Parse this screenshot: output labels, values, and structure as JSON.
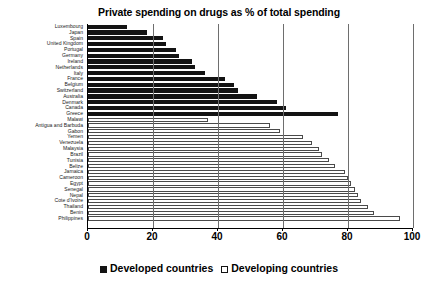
{
  "chart_data": {
    "type": "bar",
    "orientation": "horizontal",
    "title": "Private spending on drugs as % of total spending",
    "xlabel": "",
    "ylabel": "",
    "xlim": [
      0,
      100
    ],
    "xticks": [
      0,
      20,
      40,
      60,
      80,
      100
    ],
    "grid": true,
    "legend_position": "bottom",
    "legend": [
      {
        "label": "Developed countries",
        "marker": "filled-square",
        "color": "#131313"
      },
      {
        "label": "Developing countries",
        "marker": "open-square",
        "color": "#ffffff"
      }
    ],
    "categories": [
      "Luxembourg",
      "Japan",
      "Spain",
      "United  Kingdom",
      "Portugal",
      "Germany",
      "Ireland",
      "Netherlands",
      "Italy",
      "France",
      "Belgium",
      "Switzerland",
      "Australia",
      "Denmark",
      "Canada",
      "Greece",
      "Malawi",
      "Antigua and Barbuda",
      "Gabon",
      "Yemen",
      "Venezuela",
      "Malaysia",
      "Brazil",
      "Tunisia",
      "Belize",
      "Jamaica",
      "Cameroon",
      "Egypt",
      "Senegal",
      "Nepal",
      "Cote d'Ivoire",
      "Thailand",
      "Benin",
      "Philippines"
    ],
    "values": [
      12,
      18,
      23,
      24,
      27,
      28,
      32,
      33,
      36,
      42,
      45,
      46,
      52,
      58,
      61,
      77,
      37,
      56,
      59,
      66,
      69,
      71,
      72,
      74,
      76,
      79,
      80,
      81,
      82,
      83,
      84,
      86,
      88,
      96
    ],
    "groups": [
      "Developed countries",
      "Developed countries",
      "Developed countries",
      "Developed countries",
      "Developed countries",
      "Developed countries",
      "Developed countries",
      "Developed countries",
      "Developed countries",
      "Developed countries",
      "Developed countries",
      "Developed countries",
      "Developed countries",
      "Developed countries",
      "Developed countries",
      "Developed countries",
      "Developing countries",
      "Developing countries",
      "Developing countries",
      "Developing countries",
      "Developing countries",
      "Developing countries",
      "Developing countries",
      "Developing countries",
      "Developing countries",
      "Developing countries",
      "Developing countries",
      "Developing countries",
      "Developing countries",
      "Developing countries",
      "Developing countries",
      "Developing countries",
      "Developing countries",
      "Developing countries"
    ]
  }
}
